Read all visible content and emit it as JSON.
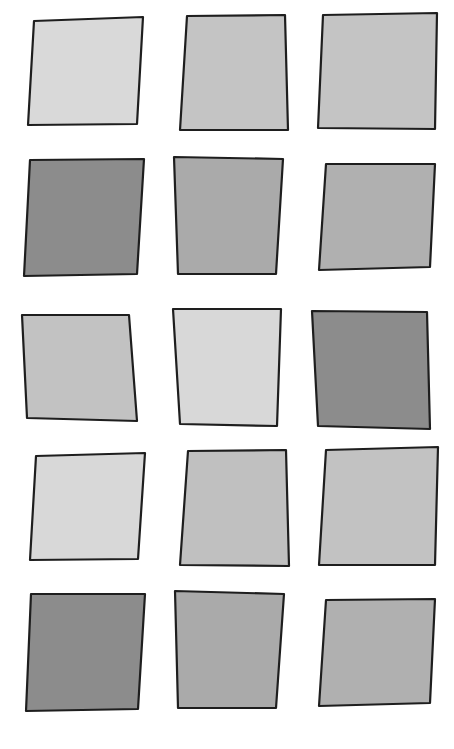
{
  "canvas": {
    "width": 454,
    "height": 749,
    "background": "#ffffff",
    "stroke": "#1e1e1e"
  },
  "grid": {
    "rows": 5,
    "cols": 3
  },
  "squares": [
    {
      "row": 1,
      "col": 1,
      "fill": "#d9d9d9",
      "points": "34,21 143,17 137,124 28,125"
    },
    {
      "row": 1,
      "col": 2,
      "fill": "#c4c4c4",
      "points": "187,16 285,15 288,130 180,130"
    },
    {
      "row": 1,
      "col": 3,
      "fill": "#c4c4c4",
      "points": "323,15 437,13 435,129 318,128"
    },
    {
      "row": 2,
      "col": 1,
      "fill": "#8c8c8c",
      "points": "30,160 144,159 137,274 24,276"
    },
    {
      "row": 2,
      "col": 2,
      "fill": "#aaaaaa",
      "points": "174,157 283,159 276,274 178,274"
    },
    {
      "row": 2,
      "col": 3,
      "fill": "#b0b0b0",
      "points": "326,164 435,164 430,267 319,270"
    },
    {
      "row": 3,
      "col": 1,
      "fill": "#c2c2c2",
      "points": "22,315 129,315 137,421 27,418"
    },
    {
      "row": 3,
      "col": 2,
      "fill": "#d8d8d8",
      "points": "173,309 281,309 277,426 180,424"
    },
    {
      "row": 3,
      "col": 3,
      "fill": "#8c8c8c",
      "points": "312,311 427,312 430,429 318,426"
    },
    {
      "row": 4,
      "col": 1,
      "fill": "#d8d8d8",
      "points": "36,456 145,453 138,559 30,560"
    },
    {
      "row": 4,
      "col": 2,
      "fill": "#c0c0c0",
      "points": "188,451 286,450 289,566 180,565"
    },
    {
      "row": 4,
      "col": 3,
      "fill": "#c2c2c2",
      "points": "326,450 438,447 435,565 319,565"
    },
    {
      "row": 5,
      "col": 1,
      "fill": "#8c8c8c",
      "points": "31,594 145,594 138,709 26,711"
    },
    {
      "row": 5,
      "col": 2,
      "fill": "#aaaaaa",
      "points": "175,591 284,594 276,708 178,708"
    },
    {
      "row": 5,
      "col": 3,
      "fill": "#b0b0b0",
      "points": "326,600 435,599 430,703 319,706"
    }
  ]
}
